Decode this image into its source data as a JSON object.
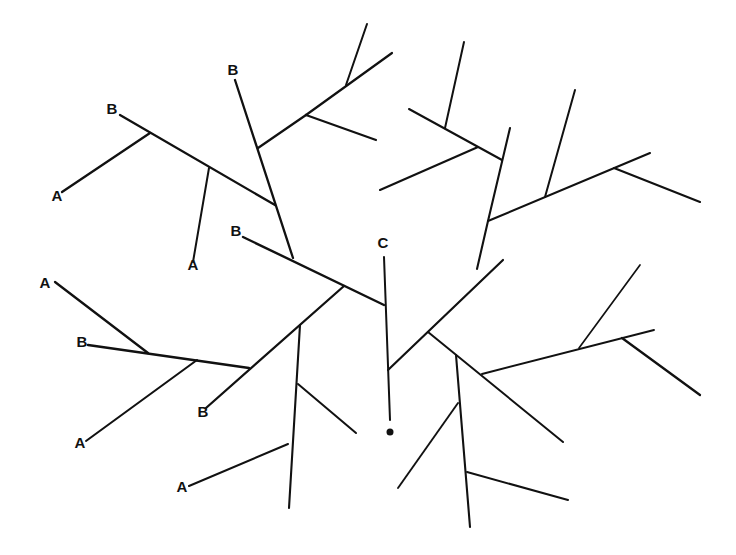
{
  "diagram": {
    "type": "branching tree diagram",
    "stroke_color": "#111111",
    "background": "#ffffff",
    "labels": [
      {
        "text": "B",
        "x": 112,
        "y": 114
      },
      {
        "text": "A",
        "x": 57,
        "y": 201
      },
      {
        "text": "B",
        "x": 233,
        "y": 75
      },
      {
        "text": "A",
        "x": 193,
        "y": 270
      },
      {
        "text": "B",
        "x": 236,
        "y": 236
      },
      {
        "text": "C",
        "x": 383,
        "y": 248
      },
      {
        "text": "A",
        "x": 45,
        "y": 288
      },
      {
        "text": "B",
        "x": 82,
        "y": 347
      },
      {
        "text": "A",
        "x": 80,
        "y": 448
      },
      {
        "text": "B",
        "x": 203,
        "y": 417
      },
      {
        "text": "A",
        "x": 182,
        "y": 492
      }
    ],
    "root_marker": {
      "x": 390,
      "y": 432,
      "r": 3.5
    },
    "segments": [
      {
        "x1": 120,
        "y1": 115,
        "x2": 275,
        "y2": 205,
        "w": 2.3
      },
      {
        "x1": 150,
        "y1": 133,
        "x2": 62,
        "y2": 192,
        "w": 2.3
      },
      {
        "x1": 209,
        "y1": 168,
        "x2": 193,
        "y2": 262,
        "w": 2
      },
      {
        "x1": 235,
        "y1": 80,
        "x2": 293,
        "y2": 258,
        "w": 2.3
      },
      {
        "x1": 258,
        "y1": 148,
        "x2": 306,
        "y2": 115,
        "w": 2.2
      },
      {
        "x1": 306,
        "y1": 115,
        "x2": 392,
        "y2": 53,
        "w": 2.2
      },
      {
        "x1": 346,
        "y1": 85,
        "x2": 367,
        "y2": 24,
        "w": 2
      },
      {
        "x1": 306,
        "y1": 115,
        "x2": 376,
        "y2": 140,
        "w": 2.2
      },
      {
        "x1": 243,
        "y1": 237,
        "x2": 384,
        "y2": 305,
        "w": 2.4
      },
      {
        "x1": 344,
        "y1": 286,
        "x2": 206,
        "y2": 408,
        "w": 2.3
      },
      {
        "x1": 384,
        "y1": 257,
        "x2": 390,
        "y2": 420,
        "w": 2
      },
      {
        "x1": 55,
        "y1": 282,
        "x2": 148,
        "y2": 353,
        "w": 2.3
      },
      {
        "x1": 88,
        "y1": 345,
        "x2": 249,
        "y2": 368,
        "w": 2.4
      },
      {
        "x1": 197,
        "y1": 360,
        "x2": 86,
        "y2": 441,
        "w": 2.1
      },
      {
        "x1": 300,
        "y1": 325,
        "x2": 289,
        "y2": 508,
        "w": 2.1
      },
      {
        "x1": 298,
        "y1": 384,
        "x2": 356,
        "y2": 433,
        "w": 2
      },
      {
        "x1": 288,
        "y1": 444,
        "x2": 189,
        "y2": 486,
        "w": 2
      },
      {
        "x1": 388,
        "y1": 370,
        "x2": 503,
        "y2": 260,
        "w": 2.2
      },
      {
        "x1": 488,
        "y1": 221,
        "x2": 510,
        "y2": 128,
        "w": 2.1
      },
      {
        "x1": 477,
        "y1": 269,
        "x2": 488,
        "y2": 221,
        "w": 2.1
      },
      {
        "x1": 409,
        "y1": 109,
        "x2": 502,
        "y2": 160,
        "w": 2.1
      },
      {
        "x1": 445,
        "y1": 128,
        "x2": 464,
        "y2": 42,
        "w": 2
      },
      {
        "x1": 478,
        "y1": 147,
        "x2": 380,
        "y2": 190,
        "w": 2.1
      },
      {
        "x1": 488,
        "y1": 221,
        "x2": 650,
        "y2": 153,
        "w": 2.1
      },
      {
        "x1": 545,
        "y1": 197,
        "x2": 575,
        "y2": 90,
        "w": 2
      },
      {
        "x1": 614,
        "y1": 168,
        "x2": 700,
        "y2": 202,
        "w": 2.1
      },
      {
        "x1": 428,
        "y1": 332,
        "x2": 563,
        "y2": 442,
        "w": 2
      },
      {
        "x1": 456,
        "y1": 355,
        "x2": 470,
        "y2": 527,
        "w": 2.1
      },
      {
        "x1": 458,
        "y1": 403,
        "x2": 398,
        "y2": 488,
        "w": 1.9
      },
      {
        "x1": 467,
        "y1": 472,
        "x2": 568,
        "y2": 500,
        "w": 2
      },
      {
        "x1": 482,
        "y1": 374,
        "x2": 654,
        "y2": 330,
        "w": 1.9
      },
      {
        "x1": 579,
        "y1": 348,
        "x2": 640,
        "y2": 265,
        "w": 1.7
      },
      {
        "x1": 622,
        "y1": 338,
        "x2": 700,
        "y2": 395,
        "w": 2.3
      }
    ]
  }
}
